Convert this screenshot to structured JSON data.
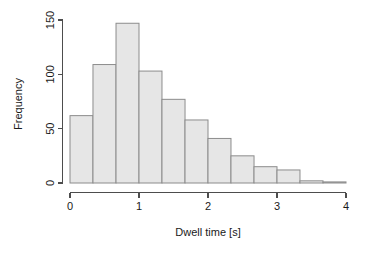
{
  "chart_data": {
    "type": "bar",
    "title": "",
    "subtitle": "",
    "xlabel": "Dwell time [s]",
    "ylabel": "Frequency",
    "grid": false,
    "legend": null,
    "xlim": [
      0,
      4.17
    ],
    "ylim": [
      0,
      150
    ],
    "xticks": [
      0,
      1,
      2,
      3,
      4
    ],
    "xtick_labels": [
      "0",
      "1",
      "2",
      "3",
      "4"
    ],
    "yticks": [
      0,
      50,
      100,
      150
    ],
    "ytick_labels": [
      "0",
      "50",
      "100",
      "150"
    ],
    "bin_width": 0.3333,
    "bin_edges": [
      0,
      0.333,
      0.667,
      1.0,
      1.333,
      1.667,
      2.0,
      2.333,
      2.667,
      3.0,
      3.333,
      3.667,
      4.0
    ],
    "categories": [
      "0-0.33",
      "0.33-0.67",
      "0.67-1.0",
      "1.0-1.33",
      "1.33-1.67",
      "1.67-2.0",
      "2.0-2.33",
      "2.33-2.67",
      "2.67-3.0",
      "3.0-3.33",
      "3.33-3.67",
      "3.67-4.0"
    ],
    "values": [
      62,
      109,
      147,
      103,
      77,
      58,
      41,
      25,
      15,
      12,
      2,
      1
    ],
    "bar_fill": "#e6e6e6",
    "bar_stroke": "#8c8c8c",
    "axis_color": "#4d4d4d"
  },
  "axes": {
    "x_title": "Dwell time [s]",
    "y_title": "Frequency"
  }
}
